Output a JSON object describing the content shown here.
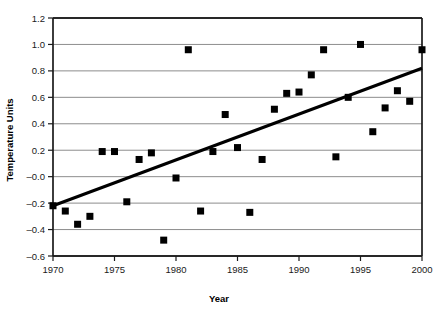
{
  "chart_data": {
    "type": "scatter",
    "title": "",
    "xlabel": "Year",
    "ylabel": "Temperature Units",
    "xlim": [
      1970,
      2000
    ],
    "ylim": [
      -0.6,
      1.2
    ],
    "grid": true,
    "legend": "none",
    "xticks": [
      1970,
      1975,
      1980,
      1985,
      1990,
      1995,
      2000
    ],
    "xtick_labels": [
      "1970",
      "1975",
      "1980",
      "1985",
      "1990",
      "1995",
      "2000"
    ],
    "yticks": [
      -0.6,
      -0.4,
      -0.2,
      0.0,
      0.2,
      0.4,
      0.6,
      0.8,
      1.0,
      1.2
    ],
    "ytick_labels": [
      "–0.6",
      "–0.4",
      "–0.2",
      "–0.0",
      "0.2",
      "0.4",
      "0.6",
      "0.8",
      "1.0",
      "1.2"
    ],
    "marker": "square",
    "marker_color": "#000000",
    "marker_size": 7,
    "series": [
      {
        "name": "Temperature anomaly",
        "x": [
          1970,
          1971,
          1972,
          1973,
          1974,
          1975,
          1976,
          1977,
          1978,
          1979,
          1980,
          1981,
          1982,
          1983,
          1984,
          1985,
          1986,
          1987,
          1988,
          1989,
          1990,
          1991,
          1992,
          1993,
          1994,
          1995,
          1996,
          1997,
          1998,
          1999,
          2000
        ],
        "y": [
          -0.22,
          -0.26,
          -0.36,
          -0.3,
          0.19,
          0.19,
          -0.19,
          0.13,
          0.18,
          -0.48,
          -0.01,
          0.96,
          -0.26,
          0.19,
          0.47,
          0.22,
          -0.27,
          0.13,
          0.51,
          0.63,
          0.64,
          0.77,
          0.96,
          0.15,
          0.6,
          1.0,
          0.34,
          0.52,
          0.65,
          0.57,
          0.96
        ]
      }
    ],
    "trendline": {
      "type": "linear",
      "x_start": 1970,
      "y_start": -0.22,
      "x_end": 2000,
      "y_end": 0.82,
      "color": "#000000",
      "width": 3
    }
  },
  "styling": {
    "background": "#ffffff",
    "grid_color": "#808080",
    "axis_color": "#1a1a1a"
  }
}
